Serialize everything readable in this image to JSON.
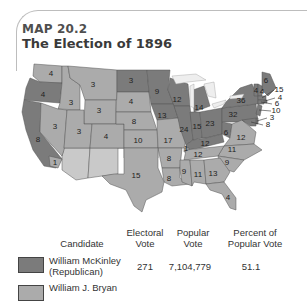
{
  "title": {
    "map_number": "MAP 20.2",
    "heading": "The Election of 1896"
  },
  "colors": {
    "republican": "#7b7b7b",
    "democrat": "#ababab",
    "territory": "#c9c9c9",
    "border": "#555555",
    "lakes": "#eeeeee"
  },
  "states": [
    {
      "name": "Washington",
      "votes": "4",
      "party": "democrat"
    },
    {
      "name": "Oregon",
      "votes": "4",
      "party": "republican"
    },
    {
      "name": "California",
      "votes": "8",
      "party": "republican"
    },
    {
      "name": "California-split",
      "votes": "1",
      "party": "democrat"
    },
    {
      "name": "Idaho",
      "votes": "3",
      "party": "democrat"
    },
    {
      "name": "Nevada",
      "votes": "3",
      "party": "democrat"
    },
    {
      "name": "Montana",
      "votes": "3",
      "party": "democrat"
    },
    {
      "name": "Wyoming",
      "votes": "3",
      "party": "democrat"
    },
    {
      "name": "Utah",
      "votes": "3",
      "party": "democrat"
    },
    {
      "name": "Colorado",
      "votes": "4",
      "party": "democrat"
    },
    {
      "name": "North Dakota",
      "votes": "3",
      "party": "republican"
    },
    {
      "name": "South Dakota",
      "votes": "4",
      "party": "democrat"
    },
    {
      "name": "Nebraska",
      "votes": "8",
      "party": "democrat"
    },
    {
      "name": "Kansas",
      "votes": "10",
      "party": "democrat"
    },
    {
      "name": "Minnesota",
      "votes": "9",
      "party": "republican"
    },
    {
      "name": "Iowa",
      "votes": "13",
      "party": "republican"
    },
    {
      "name": "Missouri",
      "votes": "17",
      "party": "democrat"
    },
    {
      "name": "Wisconsin",
      "votes": "12",
      "party": "republican"
    },
    {
      "name": "Illinois",
      "votes": "24",
      "party": "republican"
    },
    {
      "name": "Michigan",
      "votes": "14",
      "party": "republican"
    },
    {
      "name": "Indiana",
      "votes": "15",
      "party": "republican"
    },
    {
      "name": "Ohio",
      "votes": "23",
      "party": "republican"
    },
    {
      "name": "Kentucky",
      "votes": "12",
      "party": "republican"
    },
    {
      "name": "Kentucky-split",
      "votes": "1",
      "party": "democrat"
    },
    {
      "name": "West Virginia",
      "votes": "6",
      "party": "republican"
    },
    {
      "name": "Pennsylvania",
      "votes": "32",
      "party": "republican"
    },
    {
      "name": "New York",
      "votes": "36",
      "party": "republican"
    },
    {
      "name": "Virginia",
      "votes": "12",
      "party": "democrat"
    },
    {
      "name": "North Carolina",
      "votes": "11",
      "party": "democrat"
    },
    {
      "name": "Tennessee",
      "votes": "12",
      "party": "democrat"
    },
    {
      "name": "South Carolina",
      "votes": "9",
      "party": "democrat"
    },
    {
      "name": "Arkansas",
      "votes": "8",
      "party": "democrat"
    },
    {
      "name": "Louisiana",
      "votes": "8",
      "party": "democrat"
    },
    {
      "name": "Mississippi",
      "votes": "9",
      "party": "democrat"
    },
    {
      "name": "Alabama",
      "votes": "11",
      "party": "democrat"
    },
    {
      "name": "Georgia",
      "votes": "13",
      "party": "democrat"
    },
    {
      "name": "Florida",
      "votes": "4",
      "party": "democrat"
    },
    {
      "name": "Texas",
      "votes": "15",
      "party": "democrat"
    },
    {
      "name": "Maine",
      "votes": "6",
      "party": "republican"
    },
    {
      "name": "Vermont",
      "votes": "4",
      "party": "republican"
    },
    {
      "name": "New Hampshire",
      "votes": "4",
      "party": "republican"
    },
    {
      "name": "Massachusetts",
      "votes": "15",
      "party": "republican"
    },
    {
      "name": "Rhode Island",
      "votes": "4",
      "party": "republican"
    },
    {
      "name": "Connecticut",
      "votes": "6",
      "party": "republican"
    },
    {
      "name": "New Jersey",
      "votes": "10",
      "party": "republican"
    },
    {
      "name": "Delaware",
      "votes": "3",
      "party": "republican"
    },
    {
      "name": "Maryland",
      "votes": "8",
      "party": "republican"
    }
  ],
  "legend": {
    "headers": {
      "candidate": "Candidate",
      "electoral_line1": "Electoral",
      "electoral_line2": "Vote",
      "popular_line1": "Popular",
      "popular_line2": "Vote",
      "percent_line1": "Percent of",
      "percent_line2": "Popular Vote"
    },
    "rows": [
      {
        "name_line1": "William McKinley",
        "name_line2": "(Republican)",
        "electoral": "271",
        "popular": "7,104,779",
        "percent": "51.1",
        "party": "republican"
      },
      {
        "name_line1": "William J. Bryan",
        "name_line2": "",
        "electoral": "",
        "popular": "",
        "percent": "",
        "party": "democrat"
      }
    ]
  }
}
